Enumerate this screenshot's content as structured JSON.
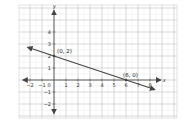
{
  "chart_data": {
    "type": "line",
    "title": "",
    "xlabel": "x",
    "ylabel": "y",
    "xlim": [
      -2.5,
      8.5
    ],
    "ylim": [
      -2.5,
      5.5
    ],
    "grid": true,
    "x_ticks": [
      -2,
      -1,
      0,
      1,
      2,
      3,
      4,
      5,
      6,
      7,
      8
    ],
    "y_ticks": [
      -2,
      -1,
      1,
      2,
      3,
      4
    ],
    "series": [
      {
        "name": "line",
        "x": [
          -2.2,
          8.4
        ],
        "y": [
          2.73,
          -0.8
        ],
        "equation": "y = -x/3 + 2",
        "arrows": "both"
      }
    ],
    "annotations": [
      {
        "text": "(0, 2)",
        "x": 0,
        "y": 2
      },
      {
        "text": "(6, 0)",
        "x": 6,
        "y": 0
      }
    ]
  },
  "labels": {
    "x_axis": "x",
    "y_axis": "y",
    "point_a": "(0, 2)",
    "point_b": "(6, 0)"
  },
  "colors": {
    "grid_major": "#cfcfcf",
    "grid_minor": "#e8e8e8",
    "axis": "#444444",
    "line": "#444444"
  }
}
